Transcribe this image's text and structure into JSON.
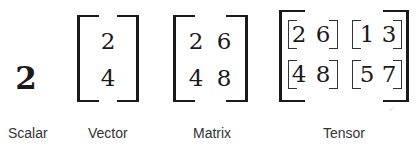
{
  "scalar": {
    "label": "Scalar",
    "value": "2"
  },
  "vector": {
    "label": "Vector",
    "values": [
      "2",
      "4"
    ]
  },
  "matrix": {
    "label": "Matrix",
    "rows": [
      [
        "2",
        "6"
      ],
      [
        "4",
        "8"
      ]
    ]
  },
  "tensor": {
    "label": "Tensor",
    "blocks": [
      [
        [
          "2",
          "6"
        ],
        [
          "1",
          "3"
        ]
      ],
      [
        [
          "4",
          "8"
        ],
        [
          "5",
          "7"
        ]
      ]
    ]
  },
  "colors": {
    "ink": "#1a1a1a",
    "label": "#333333",
    "background": "#ffffff"
  }
}
